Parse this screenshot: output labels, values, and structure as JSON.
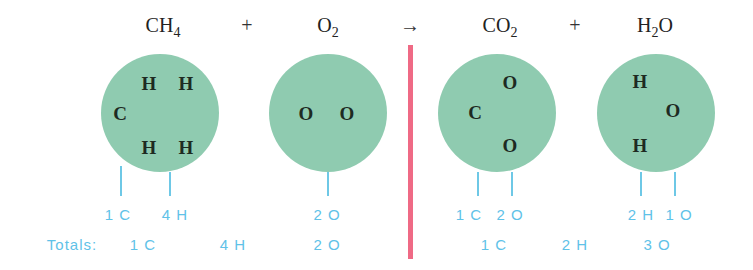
{
  "equation": {
    "reactant_1": {
      "base": "CH",
      "sub": "4"
    },
    "plus_1": "+",
    "reactant_2": {
      "base": "O",
      "sub": "2"
    },
    "arrow": "→",
    "product_1": {
      "base": "CO",
      "sub": "2"
    },
    "plus_2": "+",
    "product_2": {
      "base": "H",
      "sub": "2",
      "tail": "O"
    }
  },
  "molecules": {
    "ch4": {
      "atoms": [
        "H",
        "H",
        "C",
        "H",
        "H"
      ]
    },
    "o2": {
      "atoms": [
        "O",
        "O"
      ]
    },
    "co2": {
      "atoms": [
        "O",
        "C",
        "O"
      ]
    },
    "h2o": {
      "atoms": [
        "H",
        "O",
        "H"
      ]
    }
  },
  "counts": {
    "ch4_c": "1 C",
    "ch4_h": "4 H",
    "o2_o": "2 O",
    "co2_c": "1 C",
    "co2_o": "2 O",
    "h2o_h": "2 H",
    "h2o_o": "1 O"
  },
  "totals": {
    "label": "Totals:",
    "reactants": {
      "c": "1 C",
      "h": "4 H",
      "o": "2 O"
    },
    "products": {
      "c": "1 C",
      "h": "2 H",
      "o": "3 O"
    }
  },
  "colors": {
    "molecule": "#8fcbb0",
    "count_text": "#5fc2e8",
    "divider": "#ef6a85"
  }
}
